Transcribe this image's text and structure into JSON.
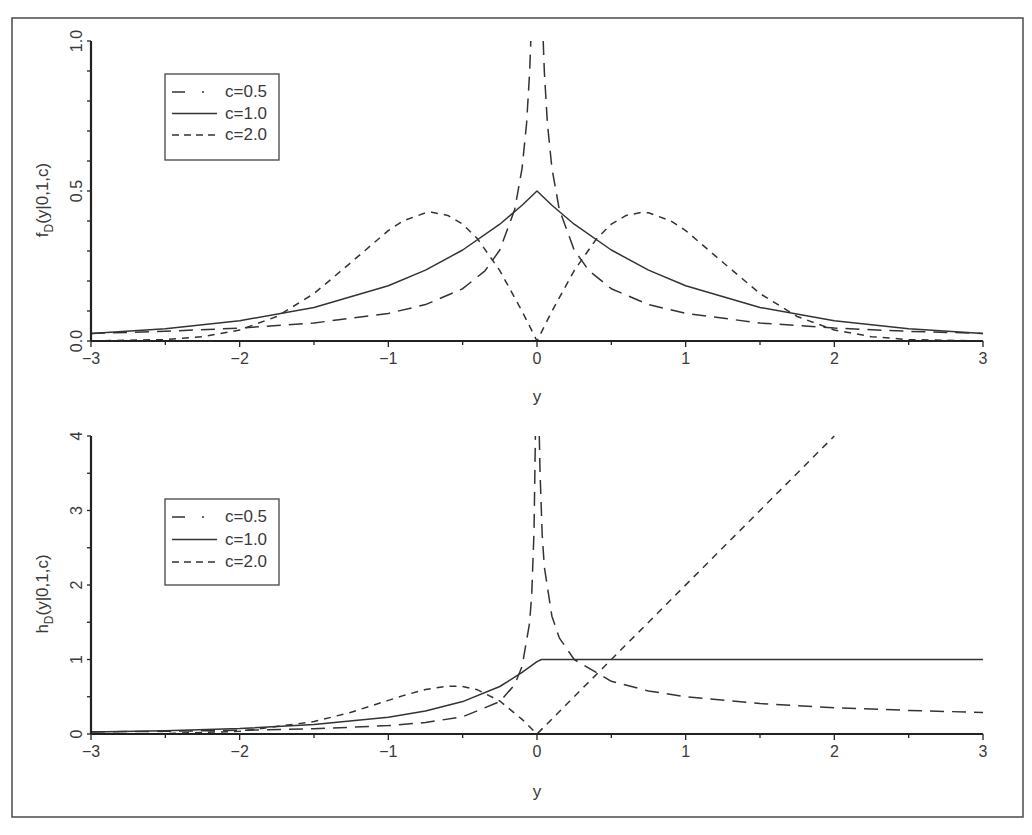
{
  "figure": {
    "panels": [
      "top",
      "bottom"
    ]
  },
  "chart_data": [
    {
      "id": "chart-density",
      "type": "line",
      "title": "",
      "xlabel": "y",
      "ylabel": "f_D(y|0,1,c)",
      "ylabel_parts": [
        "f",
        "D",
        "(y|0,1,c)"
      ],
      "xlim": [
        -3,
        3
      ],
      "ylim": [
        0,
        1
      ],
      "xticks": [
        -3,
        -2,
        -1,
        0,
        1,
        2,
        3
      ],
      "xtick_labels": [
        "−3",
        "−2",
        "−1",
        "0",
        "1",
        "2",
        "3"
      ],
      "xminor_step": 0.5,
      "yticks": [
        0,
        0.5,
        1
      ],
      "ytick_labels": [
        "0.0",
        "0.5",
        "1.0"
      ],
      "yminor_step": 0.1,
      "grid": false,
      "legend_position": "upper left",
      "legend": [
        "c=0.5",
        "c=1.0",
        "c=2.0"
      ],
      "series": [
        {
          "name": "c=0.5",
          "style": "long-dash",
          "x": [
            -3,
            -2.5,
            -2,
            -1.5,
            -1,
            -0.75,
            -0.5,
            -0.35,
            -0.25,
            -0.15,
            -0.1,
            -0.07,
            -0.05,
            -0.042,
            0,
            0.042,
            0.05,
            0.07,
            0.1,
            0.15,
            0.25,
            0.35,
            0.5,
            0.75,
            1,
            1.5,
            2,
            2.5,
            3
          ],
          "y": [
            0.0255,
            0.0325,
            0.043,
            0.06,
            0.092,
            0.1214,
            0.1743,
            0.2339,
            0.3033,
            0.4382,
            0.5763,
            0.7253,
            0.894,
            1.0,
            null,
            1.0,
            0.894,
            0.7253,
            0.5763,
            0.4382,
            0.3033,
            0.2339,
            0.1743,
            0.1214,
            0.092,
            0.06,
            0.043,
            0.0325,
            0.0255
          ]
        },
        {
          "name": "c=1.0",
          "style": "solid",
          "x": [
            -3,
            -2.5,
            -2,
            -1.5,
            -1,
            -0.75,
            -0.5,
            -0.25,
            -0.1,
            0,
            0.1,
            0.25,
            0.5,
            0.75,
            1,
            1.5,
            2,
            2.5,
            3
          ],
          "y": [
            0.0249,
            0.041,
            0.0677,
            0.1116,
            0.1839,
            0.2362,
            0.3033,
            0.3894,
            0.4524,
            0.5,
            0.4524,
            0.3894,
            0.3033,
            0.2362,
            0.1839,
            0.1116,
            0.0677,
            0.041,
            0.0249
          ]
        },
        {
          "name": "c=2.0",
          "style": "short-dash",
          "x": [
            -3,
            -2.5,
            -2.25,
            -2,
            -1.75,
            -1.5,
            -1.25,
            -1,
            -0.9,
            -0.75,
            -0.707,
            -0.6,
            -0.5,
            -0.4,
            -0.25,
            -0.1,
            0,
            0.1,
            0.25,
            0.4,
            0.5,
            0.6,
            0.707,
            0.75,
            0.9,
            1,
            1.25,
            1.5,
            1.75,
            2,
            2.25,
            2.5,
            3
          ],
          "y": [
            0.0004,
            0.0048,
            0.0142,
            0.0366,
            0.0818,
            0.1581,
            0.2622,
            0.3679,
            0.4004,
            0.4273,
            0.4289,
            0.4188,
            0.3894,
            0.3408,
            0.2348,
            0.099,
            0,
            0.099,
            0.2348,
            0.3408,
            0.3894,
            0.4188,
            0.4289,
            0.4273,
            0.4004,
            0.3679,
            0.2622,
            0.1581,
            0.0818,
            0.0366,
            0.0142,
            0.0048,
            0.0004
          ]
        }
      ]
    },
    {
      "id": "chart-hazard",
      "type": "line",
      "title": "",
      "xlabel": "y",
      "ylabel": "h_D(y|0,1,c)",
      "ylabel_parts": [
        "h",
        "D",
        "(y|0,1,c)"
      ],
      "xlim": [
        -3,
        3
      ],
      "ylim": [
        0,
        4
      ],
      "xticks": [
        -3,
        -2,
        -1,
        0,
        1,
        2,
        3
      ],
      "xtick_labels": [
        "−3",
        "−2",
        "−1",
        "0",
        "1",
        "2",
        "3"
      ],
      "xminor_step": 0.5,
      "yticks": [
        0,
        1,
        2,
        3,
        4
      ],
      "ytick_labels": [
        "0",
        "1",
        "2",
        "3",
        "4"
      ],
      "yminor_step": 0.5,
      "grid": false,
      "legend_position": "upper left",
      "legend": [
        "c=0.5",
        "c=1.0",
        "c=2.0"
      ],
      "series": [
        {
          "name": "c=0.5",
          "style": "long-dash",
          "x": [
            -3,
            -2.5,
            -2,
            -1.5,
            -1,
            -0.75,
            -0.5,
            -0.25,
            -0.15,
            -0.1,
            -0.05,
            -0.035,
            -0.02,
            -0.011,
            0,
            0.0156,
            0.02,
            0.035,
            0.05,
            0.1,
            0.15,
            0.25,
            0.5,
            0.75,
            1,
            1.5,
            2,
            2.5,
            3
          ],
          "y": [
            0.028,
            0.0362,
            0.049,
            0.0703,
            0.1127,
            0.1537,
            0.2314,
            0.4353,
            0.6634,
            0.9069,
            1.49,
            1.8936,
            2.712,
            4.0,
            null,
            4.0,
            3.536,
            2.672,
            2.236,
            1.581,
            1.291,
            1.0,
            0.7071,
            0.5774,
            0.5,
            0.4082,
            0.3536,
            0.3162,
            0.2887
          ]
        },
        {
          "name": "c=1.0",
          "style": "solid",
          "x": [
            -3,
            -2.5,
            -2,
            -1.5,
            -1,
            -0.75,
            -0.5,
            -0.25,
            -0.1,
            0,
            0.03,
            3
          ],
          "y": [
            0.0255,
            0.0428,
            0.0726,
            0.1256,
            0.2254,
            0.3092,
            0.4353,
            0.6377,
            0.8262,
            0.97,
            1,
            1
          ]
        },
        {
          "name": "c=2.0",
          "style": "short-dash",
          "x": [
            -3,
            -2.5,
            -2,
            -1.5,
            -1.25,
            -1,
            -0.9,
            -0.75,
            -0.6,
            -0.5,
            -0.4,
            -0.25,
            -0.1,
            0,
            2
          ],
          "y": [
            0.0004,
            0.0048,
            0.0369,
            0.1669,
            0.2929,
            0.4508,
            0.5149,
            0.5975,
            0.643,
            0.6377,
            0.5937,
            0.4428,
            0.196,
            0,
            4
          ]
        }
      ]
    }
  ]
}
